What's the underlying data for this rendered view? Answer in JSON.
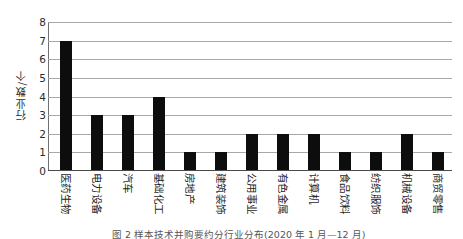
{
  "chart_data": {
    "type": "bar",
    "title": "",
    "xlabel": "",
    "ylabel": "行业数/个",
    "ylim": [
      0,
      8
    ],
    "yticks": [
      0,
      1,
      2,
      3,
      4,
      5,
      6,
      7,
      8
    ],
    "grid": true,
    "legend": false,
    "bar_color": "#0d0d0d",
    "grid_color": "#a8a8a8",
    "categories": [
      "医药生物",
      "电力设备",
      "汽车",
      "基础化工",
      "房地产",
      "建筑装饰",
      "公用事业",
      "有色金属",
      "计算机",
      "食品饮料",
      "纺织服饰",
      "机械设备",
      "商贸零售"
    ],
    "values": [
      7,
      3,
      3,
      4,
      1,
      1,
      2,
      2,
      2,
      1,
      1,
      2,
      1
    ]
  },
  "caption": {
    "text": "图 2    样本技术并购要约分行业分布(2020 年 1 月—12 月)"
  }
}
